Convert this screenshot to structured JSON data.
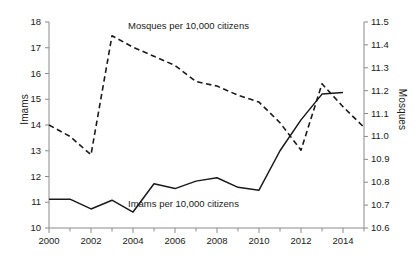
{
  "chart_data": {
    "type": "line",
    "title": "",
    "xlabel": "",
    "ylabel": "Imams",
    "ylabel_right": "Mosques",
    "xlim": [
      2000,
      2015
    ],
    "ylim": [
      10,
      18
    ],
    "ylim_right": [
      10.6,
      11.5
    ],
    "grid": false,
    "legend_position": "inline-annotations",
    "x": [
      2000,
      2001,
      2002,
      2003,
      2004,
      2005,
      2006,
      2007,
      2008,
      2009,
      2010,
      2011,
      2012,
      2013,
      2014,
      2015
    ],
    "xticks": [
      2000,
      2002,
      2004,
      2006,
      2008,
      2010,
      2012,
      2014
    ],
    "xticklabels": [
      "2000",
      "2002",
      "2004",
      "2006",
      "2008",
      "2010",
      "2012",
      "2014"
    ],
    "xticks_minor": [
      2001,
      2003,
      2005,
      2007,
      2009,
      2011,
      2013,
      2015
    ],
    "yticks_left": [
      10,
      11,
      12,
      13,
      14,
      15,
      16,
      17,
      18
    ],
    "yticklabels_left": [
      "10",
      "11",
      "12",
      "13",
      "14",
      "15",
      "16",
      "17",
      "18"
    ],
    "yticks_right": [
      10.6,
      10.7,
      10.8,
      10.9,
      11.0,
      11.1,
      11.2,
      11.3,
      11.4,
      11.5
    ],
    "yticklabels_right": [
      "10.6",
      "10.7",
      "10.8",
      "10.9",
      "11.0",
      "11.1",
      "11.2",
      "11.3",
      "11.4",
      "11.5"
    ],
    "series": [
      {
        "name": "Imams per 10,000 citizens",
        "axis": "left",
        "style": "solid",
        "color": "#1a1a1a",
        "x": [
          2000,
          2001,
          2002,
          2003,
          2004,
          2005,
          2006,
          2007,
          2008,
          2009,
          2010,
          2011,
          2012,
          2013,
          2014
        ],
        "values": [
          11.12,
          11.12,
          10.74,
          11.08,
          10.62,
          11.72,
          11.53,
          11.82,
          11.95,
          11.58,
          11.47,
          13.0,
          14.2,
          15.2,
          15.26
        ]
      },
      {
        "name": "Mosques per 10,000 citizens",
        "axis": "right",
        "style": "dashed",
        "color": "#1a1a1a",
        "x": [
          2000,
          2001,
          2002,
          2003,
          2004,
          2005,
          2006,
          2007,
          2008,
          2009,
          2010,
          2011,
          2012,
          2013,
          2014,
          2015
        ],
        "values": [
          11.05,
          11.0,
          10.92,
          11.44,
          11.39,
          11.35,
          11.31,
          11.24,
          11.22,
          11.18,
          11.15,
          11.06,
          10.94,
          11.23,
          11.13,
          11.04
        ]
      }
    ],
    "annotations": [
      {
        "text": "Mosques per 10,000 citizens",
        "x_px": 128,
        "y_px": 20
      },
      {
        "text": "Imams per 10,000 citizens",
        "x_px": 128,
        "y_px": 198
      }
    ]
  }
}
